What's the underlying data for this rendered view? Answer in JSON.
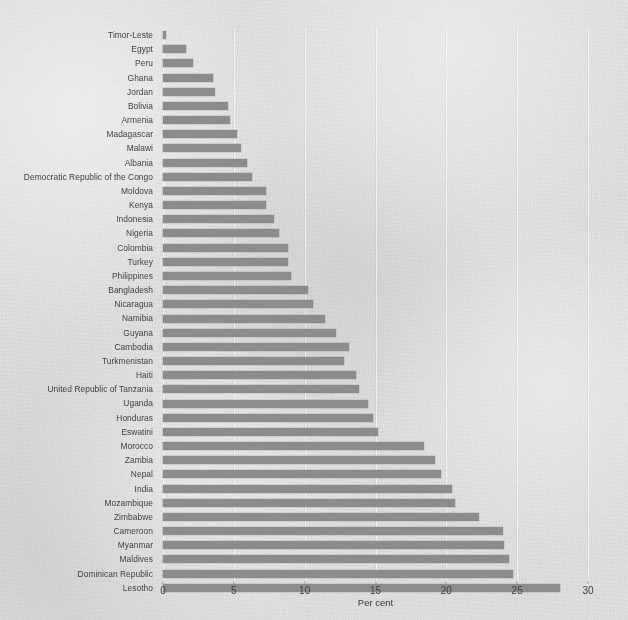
{
  "chart_data": {
    "type": "bar",
    "orientation": "horizontal",
    "title": "",
    "subtitle": "",
    "xlabel": "Per cent",
    "ylabel": "",
    "xlim": [
      0,
      30
    ],
    "xticks": [
      0,
      5,
      10,
      15,
      20,
      25,
      30
    ],
    "xtick_labels": [
      "0",
      "5",
      "10",
      "15",
      "20",
      "25",
      "30"
    ],
    "grid": true,
    "grid_axis": "x",
    "legend": null,
    "bar_color": "#8c8c8b",
    "background_color": "#dfdfde",
    "categories": [
      "Timor-Leste",
      "Egypt",
      "Peru",
      "Ghana",
      "Jordan",
      "Bolivia",
      "Armenia",
      "Madagascar",
      "Malawi",
      "Albania",
      "Democratic Republic of the Congo",
      "Moldova",
      "Kenya",
      "Indonesia",
      "Nigeria",
      "Colombia",
      "Turkey",
      "Philippines",
      "Bangladesh",
      "Nicaragua",
      "Namibia",
      "Guyana",
      "Cambodia",
      "Turkmenistan",
      "Haiti",
      "United Republic of Tanzania",
      "Uganda",
      "Honduras",
      "Eswatini",
      "Morocco",
      "Zambia",
      "Nepal",
      "India",
      "Mozambique",
      "Zimbabwe",
      "Cameroon",
      "Myanmar",
      "Maldives",
      "Dominican Republic",
      "Lesotho"
    ],
    "values": [
      0.2,
      1.6,
      2.1,
      3.5,
      3.7,
      4.6,
      4.7,
      5.2,
      5.5,
      5.9,
      6.3,
      7.3,
      7.3,
      7.8,
      8.2,
      8.8,
      8.8,
      9.0,
      10.2,
      10.6,
      11.4,
      12.2,
      13.1,
      12.8,
      13.6,
      13.8,
      14.5,
      14.8,
      15.2,
      18.4,
      19.2,
      19.6,
      20.4,
      20.6,
      22.3,
      24.0,
      24.1,
      24.4,
      24.7,
      28.0
    ]
  }
}
